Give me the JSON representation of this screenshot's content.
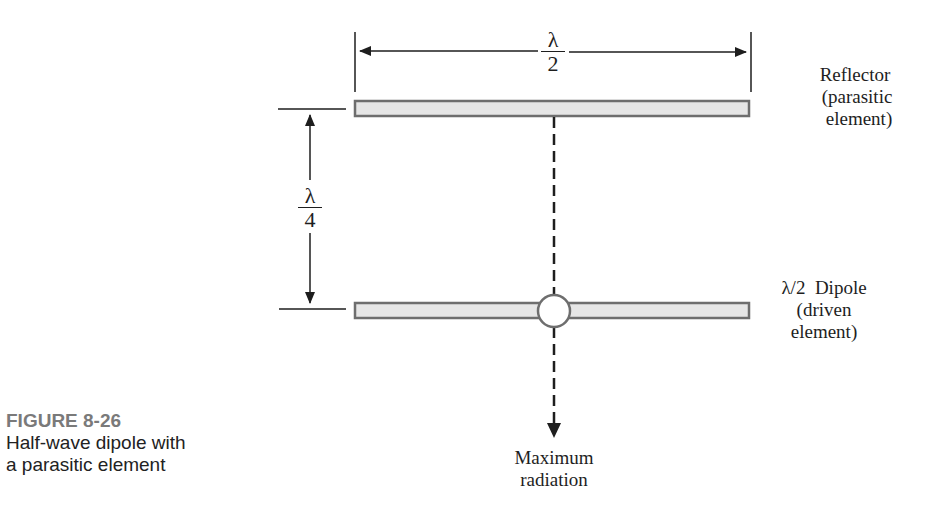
{
  "figure": {
    "number_label": "FIGURE 8-26",
    "caption_line1": "Half-wave dipole with",
    "caption_line2": "a parasitic element"
  },
  "dimensions": {
    "top_span": {
      "numerator": "λ",
      "denominator": "2"
    },
    "spacing": {
      "numerator": "λ",
      "denominator": "4"
    }
  },
  "elements": {
    "reflector": {
      "line1": "Reflector",
      "line2": "(parasitic",
      "line3": "element)"
    },
    "dipole": {
      "line1": "λ/2  Dipole",
      "line2": "(driven",
      "line3": "element)"
    }
  },
  "radiation": {
    "line1": "Maximum",
    "line2": "radiation"
  },
  "colors": {
    "element_fill": "#e6e6e6",
    "element_stroke": "#6e6e6e",
    "line": "#1e1e1e",
    "caption_heading": "#7a7a7a"
  }
}
